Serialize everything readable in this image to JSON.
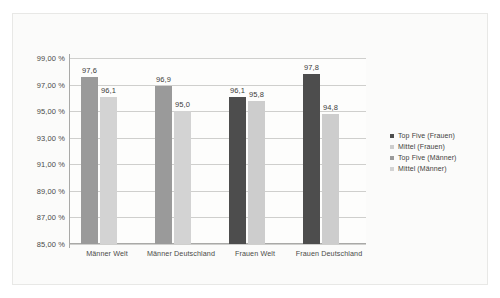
{
  "chart_data": {
    "type": "bar",
    "title": "",
    "subtitle": "",
    "xlabel": "",
    "ylabel": "",
    "ylim": [
      85,
      99
    ],
    "ytick_values": [
      85,
      87,
      89,
      91,
      93,
      95,
      97,
      99
    ],
    "ytick_labels": [
      "85,00 %",
      "87,00 %",
      "89,00 %",
      "91,00 %",
      "93,00 %",
      "95,00 %",
      "97,00 %",
      "99,00 %"
    ],
    "grid": true,
    "legend_position": "right",
    "categories": [
      "Männer Welt",
      "Männer Deutschland",
      "Frauen Welt",
      "Frauen Deutschland"
    ],
    "series": [
      {
        "name": "Top Five (Frauen)",
        "color": "#4d4d4d",
        "values": [
          null,
          null,
          96.1,
          97.8
        ],
        "value_labels": [
          "",
          "",
          "96,1",
          "97,8"
        ]
      },
      {
        "name": "Mittel (Frauen)",
        "color": "#cdcdcd",
        "values": [
          null,
          null,
          95.8,
          94.8
        ],
        "value_labels": [
          "",
          "",
          "95,8",
          "94,8"
        ]
      },
      {
        "name": "Top Five (Männer)",
        "color": "#9a9a9a",
        "values": [
          97.6,
          96.9,
          null,
          null
        ],
        "value_labels": [
          "97,6",
          "96,9",
          "",
          ""
        ]
      },
      {
        "name": "Mittel (Männer)",
        "color": "#d3d3d3",
        "values": [
          96.1,
          95.0,
          null,
          null
        ],
        "value_labels": [
          "96,1",
          "95,0",
          "",
          ""
        ]
      }
    ],
    "bars": [
      {
        "category": "Männer Welt",
        "series": "Top Five (Männer)",
        "value": 97.6,
        "label": "97,6",
        "color": "#9a9a9a"
      },
      {
        "category": "Männer Welt",
        "series": "Mittel (Männer)",
        "value": 96.1,
        "label": "96,1",
        "color": "#d3d3d3"
      },
      {
        "category": "Männer Deutschland",
        "series": "Top Five (Männer)",
        "value": 96.9,
        "label": "96,9",
        "color": "#9a9a9a"
      },
      {
        "category": "Männer Deutschland",
        "series": "Mittel (Männer)",
        "value": 95.0,
        "label": "95,0",
        "color": "#d3d3d3"
      },
      {
        "category": "Frauen Welt",
        "series": "Top Five (Frauen)",
        "value": 96.1,
        "label": "96,1",
        "color": "#4d4d4d"
      },
      {
        "category": "Frauen Welt",
        "series": "Mittel (Frauen)",
        "value": 95.8,
        "label": "95,8",
        "color": "#cdcdcd"
      },
      {
        "category": "Frauen Deutschland",
        "series": "Top Five (Frauen)",
        "value": 97.8,
        "label": "97,8",
        "color": "#4d4d4d"
      },
      {
        "category": "Frauen Deutschland",
        "series": "Mittel (Frauen)",
        "value": 94.8,
        "label": "94,8",
        "color": "#cdcdcd"
      }
    ]
  },
  "legend": {
    "items": [
      {
        "label": "Top Five (Frauen)",
        "color": "#4d4d4d"
      },
      {
        "label": "Mittel (Frauen)",
        "color": "#cdcdcd"
      },
      {
        "label": "Top Five (Männer)",
        "color": "#9a9a9a"
      },
      {
        "label": "Mittel (Männer)",
        "color": "#d3d3d3"
      }
    ]
  }
}
